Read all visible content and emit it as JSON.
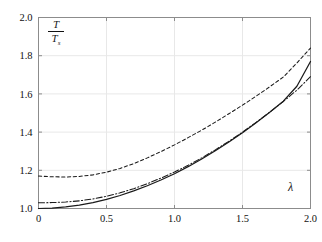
{
  "figure": {
    "background_color": "#ffffff",
    "frame_color": "#8c8c8c",
    "grid_color": "#e8e8e8",
    "curve_color": "#1a1a1a"
  },
  "axis_labels": {
    "y_numerator": "T",
    "y_denominator": "T",
    "y_denominator_sub": "s",
    "x_symbol": "λ"
  },
  "chart_data": {
    "type": "line",
    "title": "",
    "xlabel": "λ",
    "ylabel": "T/T_s",
    "xlim": [
      0,
      2.0
    ],
    "ylim": [
      1.0,
      2.0
    ],
    "xticks": [
      0,
      0.5,
      1.0,
      1.5,
      2.0
    ],
    "xticklabels": [
      "0",
      "0.5",
      "1.0",
      "1.5",
      "2.0"
    ],
    "yticks": [
      1.0,
      1.2,
      1.4,
      1.6,
      1.8,
      2.0
    ],
    "yticklabels": [
      "1.0",
      "1.2",
      "1.4",
      "1.6",
      "1.8",
      "2.0"
    ],
    "grid": true,
    "legend": "none",
    "x": [
      0,
      0.1,
      0.2,
      0.3,
      0.4,
      0.5,
      0.6,
      0.7,
      0.8,
      0.9,
      1.0,
      1.1,
      1.2,
      1.3,
      1.4,
      1.5,
      1.6,
      1.7,
      1.8,
      1.9,
      2.0
    ],
    "series": [
      {
        "name": "dashed",
        "style": "dashed",
        "values": [
          1.17,
          1.166,
          1.165,
          1.168,
          1.176,
          1.19,
          1.21,
          1.235,
          1.265,
          1.298,
          1.333,
          1.371,
          1.41,
          1.452,
          1.496,
          1.541,
          1.588,
          1.637,
          1.688,
          1.762,
          1.84
        ]
      },
      {
        "name": "dash-dot",
        "style": "dashdot",
        "values": [
          1.03,
          1.031,
          1.034,
          1.04,
          1.05,
          1.064,
          1.082,
          1.104,
          1.13,
          1.159,
          1.191,
          1.226,
          1.265,
          1.307,
          1.352,
          1.4,
          1.451,
          1.504,
          1.56,
          1.62,
          1.69
        ]
      },
      {
        "name": "solid",
        "style": "solid",
        "values": [
          1.0,
          1.002,
          1.008,
          1.018,
          1.031,
          1.048,
          1.068,
          1.092,
          1.119,
          1.149,
          1.182,
          1.219,
          1.259,
          1.302,
          1.348,
          1.397,
          1.449,
          1.504,
          1.562,
          1.64,
          1.77
        ]
      }
    ]
  }
}
